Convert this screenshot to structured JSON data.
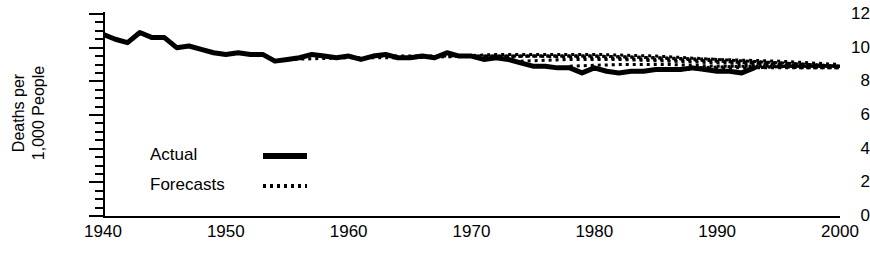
{
  "chart_data": {
    "type": "line",
    "title": "",
    "xlabel": "",
    "ylabel": "Deaths per 1,000 People",
    "ylabel_lines": [
      "Deaths per",
      "1,000 People"
    ],
    "xlim": [
      1940,
      2000
    ],
    "ylim": [
      0,
      12
    ],
    "grid": false,
    "legend_position": "inside-left",
    "y_ticks_major": [
      0,
      2,
      4,
      6,
      8,
      10,
      12
    ],
    "y_ticks_minor": [
      0.5,
      1,
      1.5,
      2.5,
      3,
      3.5,
      4.5,
      5,
      5.5,
      6.5,
      7,
      7.5,
      8.5,
      9,
      9.5,
      10.5,
      11,
      11.5
    ],
    "x_ticks": [
      1940,
      1950,
      1960,
      1970,
      1980,
      1990,
      2000
    ],
    "x_tick_labels": [
      "1940",
      "1950",
      "1960",
      "1970",
      "1980",
      "1990",
      "2000"
    ],
    "y_tick_labels": [
      "0",
      "2",
      "4",
      "6",
      "8",
      "10",
      "12"
    ],
    "series": [
      {
        "name": "Actual",
        "style": "solid-thick",
        "color": "#000000",
        "x": [
          1940,
          1941,
          1942,
          1943,
          1944,
          1945,
          1946,
          1947,
          1948,
          1949,
          1950,
          1951,
          1952,
          1953,
          1954,
          1955,
          1956,
          1957,
          1958,
          1959,
          1960,
          1961,
          1962,
          1963,
          1964,
          1965,
          1966,
          1967,
          1968,
          1969,
          1970,
          1971,
          1972,
          1973,
          1974,
          1975,
          1976,
          1977,
          1978,
          1979,
          1980,
          1981,
          1982,
          1983,
          1984,
          1985,
          1986,
          1987,
          1988,
          1989,
          1990,
          1991,
          1992,
          1993
        ],
        "values": [
          10.8,
          10.5,
          10.3,
          10.9,
          10.6,
          10.6,
          10.0,
          10.1,
          9.9,
          9.7,
          9.6,
          9.7,
          9.6,
          9.6,
          9.2,
          9.3,
          9.4,
          9.6,
          9.5,
          9.4,
          9.5,
          9.3,
          9.5,
          9.6,
          9.4,
          9.4,
          9.5,
          9.4,
          9.7,
          9.5,
          9.5,
          9.3,
          9.4,
          9.3,
          9.1,
          8.9,
          8.9,
          8.8,
          8.8,
          8.5,
          8.8,
          8.6,
          8.5,
          8.6,
          8.6,
          8.7,
          8.7,
          8.7,
          8.8,
          8.7,
          8.6,
          8.6,
          8.5,
          8.8
        ]
      },
      {
        "name": "Forecasts",
        "style": "dotted",
        "color": "#000000",
        "vintages": [
          {
            "start": 1955,
            "x": [
              1955,
              1960,
              1965,
              1970,
              1975,
              1980,
              1985,
              1990,
              1995,
              2000
            ],
            "values": [
              9.3,
              9.4,
              9.4,
              9.5,
              9.5,
              9.5,
              9.4,
              9.3,
              9.2,
              9.0
            ]
          },
          {
            "start": 1962,
            "x": [
              1962,
              1966,
              1970,
              1975,
              1980,
              1985,
              1990,
              1995,
              2000
            ],
            "values": [
              9.5,
              9.5,
              9.5,
              9.5,
              9.4,
              9.3,
              9.2,
              9.1,
              8.9
            ]
          },
          {
            "start": 1969,
            "x": [
              1969,
              1972,
              1976,
              1980,
              1985,
              1990,
              1995,
              2000
            ],
            "values": [
              9.5,
              9.6,
              9.6,
              9.6,
              9.5,
              9.3,
              9.1,
              8.9
            ]
          },
          {
            "start": 1971,
            "x": [
              1971,
              1975,
              1980,
              1985,
              1990,
              1995,
              2000
            ],
            "values": [
              9.4,
              9.5,
              9.5,
              9.4,
              9.2,
              9.0,
              8.9
            ]
          },
          {
            "start": 1974,
            "x": [
              1974,
              1978,
              1982,
              1986,
              1990,
              1995,
              2000
            ],
            "values": [
              9.2,
              9.3,
              9.3,
              9.2,
              9.1,
              9.0,
              8.8
            ]
          },
          {
            "start": 1978,
            "x": [
              1978,
              1982,
              1986,
              1990,
              1994,
              1997,
              2000
            ],
            "values": [
              8.9,
              9.0,
              9.0,
              8.9,
              8.9,
              8.8,
              8.8
            ]
          },
          {
            "start": 1983,
            "x": [
              1983,
              1987,
              1991,
              1995,
              2000
            ],
            "values": [
              8.6,
              8.7,
              8.8,
              8.8,
              8.8
            ]
          },
          {
            "start": 1988,
            "x": [
              1988,
              1992,
              1996,
              2000
            ],
            "values": [
              8.8,
              8.9,
              8.9,
              8.9
            ]
          },
          {
            "start": 1993,
            "x": [
              1993,
              1996,
              2000
            ],
            "values": [
              8.8,
              8.9,
              8.9
            ]
          }
        ]
      }
    ],
    "annotations": []
  },
  "legend": {
    "items": [
      {
        "label": "Actual",
        "swatch": "solid-line-swatch"
      },
      {
        "label": "Forecasts",
        "swatch": "dotted-line-swatch"
      }
    ]
  }
}
